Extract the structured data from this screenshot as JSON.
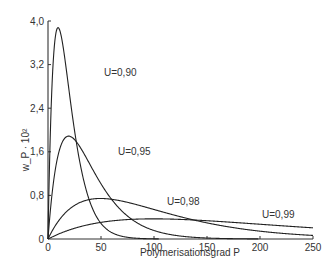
{
  "chart_data": {
    "type": "line",
    "title": "",
    "xlabel": "Polymerisationsgrad P",
    "ylabel": "w_P · 10²",
    "xlim": [
      0,
      250
    ],
    "ylim": [
      0,
      4.0
    ],
    "x_ticks": [
      "0",
      "50",
      "100",
      "150",
      "200",
      "250"
    ],
    "y_ticks": [
      "0",
      "0,8",
      "1,6",
      "2,4",
      "3,2",
      "4,0"
    ],
    "grid": false,
    "legend": "inline labels",
    "formula": "w_P = P (1-U)^2 U^(P-1)",
    "series": [
      {
        "name": "U=0,90",
        "label": "U=0,90",
        "U": 0.9,
        "peak_P": 10,
        "peak_value": 3.87
      },
      {
        "name": "U=0,95",
        "label": "U=0,95",
        "U": 0.95,
        "peak_P": 20,
        "peak_value": 1.89
      },
      {
        "name": "U=0,98",
        "label": "U=0,98",
        "U": 0.98,
        "peak_P": 50,
        "peak_value": 0.75
      },
      {
        "name": "U=0,99",
        "label": "U=0,99",
        "U": 0.99,
        "peak_P": 100,
        "peak_value": 0.37
      }
    ]
  }
}
